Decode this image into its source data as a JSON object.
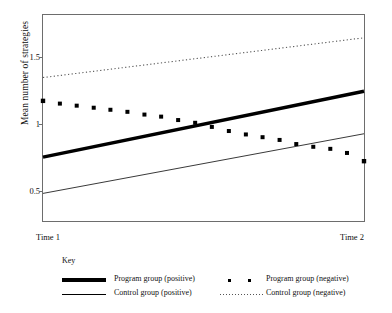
{
  "chart_data": {
    "type": "line",
    "title": "",
    "xlabel": "",
    "ylabel": "Mean number of strategies",
    "x": [
      "Time 1",
      "Time 2"
    ],
    "xtick_labels": [
      "Time 1",
      "Time 2"
    ],
    "ytick_labels": [
      "1.5",
      "1",
      "0.5"
    ],
    "ytick_values": [
      1.5,
      1.0,
      0.5
    ],
    "ylim": [
      0.34,
      1.85
    ],
    "xlim": [
      0,
      1
    ],
    "grid": false,
    "legend_position": "bottom",
    "legend_title": "Key",
    "series": [
      {
        "name": "Program group (positive)",
        "style": "thick-solid",
        "color": "#000000",
        "x": [
          0,
          1
        ],
        "values": [
          0.81,
          1.29
        ]
      },
      {
        "name": "Control group (positive)",
        "style": "thin-solid",
        "color": "#000000",
        "x": [
          0,
          1
        ],
        "values": [
          0.545,
          0.98
        ]
      },
      {
        "name": "Program group (negative)",
        "style": "square-markers",
        "color": "#000000",
        "x": [
          0,
          0.0526,
          0.105,
          0.158,
          0.21,
          0.263,
          0.316,
          0.368,
          0.421,
          0.474,
          0.526,
          0.579,
          0.632,
          0.684,
          0.737,
          0.789,
          0.842,
          0.895,
          0.947,
          1
        ],
        "values": [
          1.22,
          1.2,
          1.185,
          1.17,
          1.155,
          1.14,
          1.12,
          1.105,
          1.08,
          1.06,
          1.03,
          1.0,
          0.975,
          0.955,
          0.935,
          0.905,
          0.885,
          0.87,
          0.84,
          0.78
        ]
      },
      {
        "name": "Control group (negative)",
        "style": "dotted",
        "color": "#000000",
        "x": [
          0,
          1
        ],
        "values": [
          1.39,
          1.68
        ]
      }
    ]
  },
  "axis": {
    "y_title": "Mean number of strategies",
    "ytick_1": "1.5",
    "ytick_2": "1",
    "ytick_3": "0.5",
    "xtick_left": "Time 1",
    "xtick_right": "Time 2"
  },
  "legend": {
    "title": "Key",
    "entries": [
      {
        "label": "Program group (positive)",
        "marker": "thick-line"
      },
      {
        "label": "Control group (positive)",
        "marker": "thin-line"
      },
      {
        "label": "Program group (negative)",
        "marker": "squares"
      },
      {
        "label": "Control group (negative)",
        "marker": "dotted-line"
      }
    ]
  },
  "colors": {
    "ink": "#000000",
    "frame": "#6d6d6d",
    "dotted": "#555555",
    "background": "#ffffff"
  }
}
